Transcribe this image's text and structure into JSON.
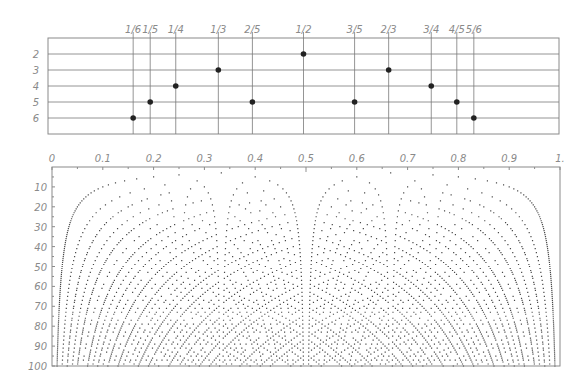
{
  "chart_data": [
    {
      "type": "scatter",
      "title": "",
      "xlabel": "fraction p/q",
      "ylabel": "denominator q",
      "xlim": [
        0,
        1
      ],
      "ylim": [
        1,
        7
      ],
      "y_inverted": true,
      "grid": true,
      "x_ticks": [
        {
          "label": "1/6",
          "value": 0.16667
        },
        {
          "label": "1/5",
          "value": 0.2
        },
        {
          "label": "1/4",
          "value": 0.25
        },
        {
          "label": "1/3",
          "value": 0.33333
        },
        {
          "label": "2/5",
          "value": 0.4
        },
        {
          "label": "1/2",
          "value": 0.5
        },
        {
          "label": "3/5",
          "value": 0.6
        },
        {
          "label": "2/3",
          "value": 0.66667
        },
        {
          "label": "3/4",
          "value": 0.75
        },
        {
          "label": "4/5",
          "value": 0.8
        },
        {
          "label": "5/6",
          "value": 0.83333
        }
      ],
      "y_ticks": [
        "2",
        "3",
        "4",
        "5",
        "6"
      ],
      "points": [
        {
          "label": "1/6",
          "x": 0.16667,
          "y": 6
        },
        {
          "label": "1/5",
          "x": 0.2,
          "y": 5
        },
        {
          "label": "1/4",
          "x": 0.25,
          "y": 4
        },
        {
          "label": "1/3",
          "x": 0.33333,
          "y": 3
        },
        {
          "label": "2/5",
          "x": 0.4,
          "y": 5
        },
        {
          "label": "1/2",
          "x": 0.5,
          "y": 2
        },
        {
          "label": "3/5",
          "x": 0.6,
          "y": 5
        },
        {
          "label": "2/3",
          "x": 0.66667,
          "y": 3
        },
        {
          "label": "3/4",
          "x": 0.75,
          "y": 4
        },
        {
          "label": "4/5",
          "x": 0.8,
          "y": 5
        },
        {
          "label": "5/6",
          "x": 0.83333,
          "y": 6
        }
      ]
    },
    {
      "type": "scatter",
      "title": "",
      "description": "All reduced fractions p/q in (0,1) plotted at (p/q, q)",
      "xlabel": "",
      "ylabel": "",
      "xlim": [
        0,
        1
      ],
      "ylim": [
        0,
        100
      ],
      "y_inverted": true,
      "q_range": [
        2,
        100
      ],
      "grid": false,
      "x_ticks": [
        "0",
        "0.1",
        "0.2",
        "0.3",
        "0.4",
        "0.5",
        "0.6",
        "0.7",
        "0.8",
        "0.9",
        "1."
      ],
      "y_ticks": [
        "10",
        "20",
        "30",
        "40",
        "50",
        "60",
        "70",
        "80",
        "90",
        "100"
      ]
    }
  ],
  "colors": {
    "grid": "#7a7a7a",
    "frame": "#8a8a8a",
    "label": "#8a8a8a",
    "top_point": "#222222",
    "bottom_point": "#4a4a4a"
  }
}
